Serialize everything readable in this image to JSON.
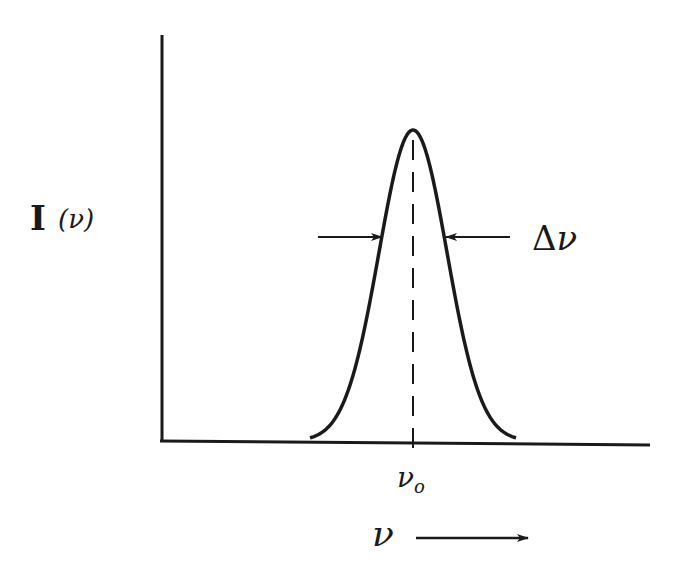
{
  "diagram": {
    "y_axis_label": "I (ν)",
    "y_axis_label_main": "I",
    "y_axis_label_arg": "(ν)",
    "x_axis_label": "ν",
    "center_label": "ν",
    "center_subscript": "o",
    "width_label": "Δν",
    "width_label_delta": "Δ",
    "width_label_nu": "ν",
    "curve": {
      "shape": "gaussian",
      "center": "ν0",
      "peak_relative_height": 1.0
    },
    "colors": {
      "ink": "#1a1a1a",
      "background": "#ffffff"
    }
  }
}
